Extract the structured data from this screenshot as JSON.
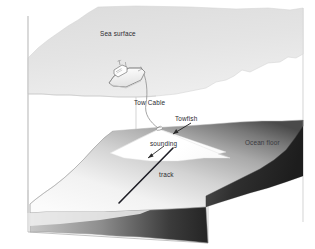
{
  "figure": {
    "kind": "sonar-survey-block-diagram"
  },
  "labels": {
    "sea_surface": "Sea surface",
    "tow_cable": "Tow Cable",
    "towfish": "Towfish",
    "sounding": "sounding",
    "ocean_floor": "Ocean floor",
    "track": "track"
  },
  "colors": {
    "background": "#ffffff",
    "sea_surface_fill": "#e2e2e2",
    "sea_surface_edge": "#c9c9c9",
    "water_box_edge": "#b9b9b9",
    "ocean_floor_light": "#f4f4f4",
    "ocean_floor_mid": "#9a9a9a",
    "ocean_floor_dark": "#2e2e2e",
    "floor_front_face": "#d8d8d8",
    "sounding_beam": "#ffffff",
    "ship_hull": "#fbfbfb",
    "ship_outline": "#6e6e6e",
    "cable_line": "#8c8c8c",
    "track_line": "#20202a",
    "label_text": "#2a2a30"
  },
  "elements": {
    "ship": "survey-vessel",
    "towfish": "towed-sonar-body",
    "cable": "tow-cable-curve",
    "beam": "sounding-fan-beam",
    "track": "survey-track-line",
    "leader_towfish": "towfish-leader-arrow",
    "leader_track": "track-leader-line"
  }
}
